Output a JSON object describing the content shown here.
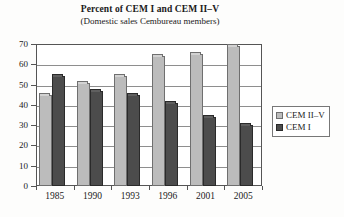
{
  "chart_data": {
    "type": "bar",
    "title": "Percent of CEM I and CEM II–V",
    "subtitle": "(Domestic sales Cembureau members)",
    "xlabel": "",
    "ylabel": "",
    "ylim": [
      0,
      70
    ],
    "ytick_step": 10,
    "yticks": [
      0,
      10,
      20,
      30,
      40,
      50,
      60,
      70
    ],
    "ytick_labels": [
      "0",
      "10",
      "20",
      "30",
      "40",
      "50",
      "60",
      "70"
    ],
    "categories": [
      "1985",
      "1990",
      "1993",
      "1996",
      "2001",
      "2005"
    ],
    "grid": true,
    "grid_axis": "y",
    "legend_position": "right",
    "series": [
      {
        "name": "CEM II–V",
        "color": "#bcbcbc",
        "values": [
          45,
          51,
          54,
          64,
          65,
          69
        ]
      },
      {
        "name": "CEM I",
        "color": "#4c4c4c",
        "values": [
          54,
          47,
          45,
          41,
          34,
          30
        ]
      }
    ]
  },
  "legend": {
    "items": [
      {
        "label": "CEM II–V"
      },
      {
        "label": "CEM I"
      }
    ]
  }
}
